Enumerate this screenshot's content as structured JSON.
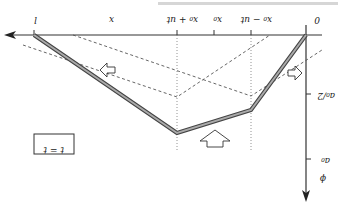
{
  "figure": {
    "orientation": "rotated-180",
    "caption_fragment": "(partial upside-down caption text cut off at top)",
    "x_axis": {
      "label": "x",
      "ticks": [
        "l",
        "x₀ + ut",
        "x₀",
        "x₀ − ut",
        "0"
      ]
    },
    "y_axis": {
      "label": "ϕ",
      "ticks": [
        "a₀/2",
        "a₀"
      ]
    },
    "box_label": "t = t",
    "colors": {
      "axis": "#333333",
      "profile": "#888888",
      "profile_edge": "#444444",
      "dashed": "#555555",
      "dotted": "#777777"
    },
    "arrows": [
      "left-arrow",
      "right-arrow",
      "up-arrow"
    ]
  }
}
